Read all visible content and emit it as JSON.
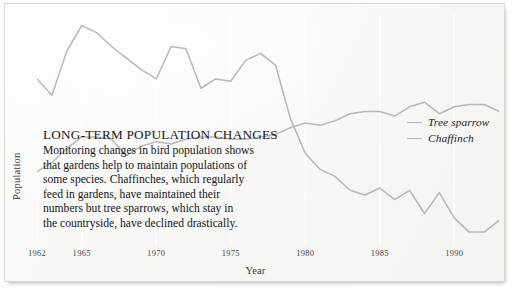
{
  "figure": {
    "background_color": "#f7f7f5",
    "border_color": "#d8d8d4"
  },
  "callout": {
    "headline": "LONG-TERM POPULATION CHANGES",
    "lines": [
      "Monitoring changes in bird population shows",
      "that gardens help to maintain populations of",
      "some species. Chaffinches, which regularly",
      "feed in gardens, have maintained their",
      "numbers but tree sparrows, which stay in",
      "the countryside, have declined drastically."
    ]
  },
  "legend": {
    "position": "right",
    "entries": [
      {
        "label": "Tree sparrow",
        "color": "#b7b7b4"
      },
      {
        "label": "Chaffinch",
        "color": "#b7b7b4"
      }
    ]
  },
  "axes": {
    "ylabel": "Population",
    "xlabel": "Year",
    "xticks": [
      "1962",
      "1965",
      "1970",
      "1975",
      "1980",
      "1985",
      "1990"
    ],
    "yticks": [],
    "grid": "vertical-only"
  },
  "chart_data": {
    "type": "line",
    "title": "LONG-TERM POPULATION CHANGES",
    "xlabel": "Year",
    "ylabel": "Population",
    "xlim": [
      1962,
      1993
    ],
    "ylim": [
      0,
      100
    ],
    "grid": "vertical gridlines at labelled years",
    "legend_position": "right",
    "tick_labels": {
      "x": [
        "1962",
        "1965",
        "1970",
        "1975",
        "1980",
        "1985",
        "1990"
      ],
      "y": []
    },
    "x": [
      1962,
      1963,
      1964,
      1965,
      1966,
      1967,
      1968,
      1969,
      1970,
      1971,
      1972,
      1973,
      1974,
      1975,
      1976,
      1977,
      1978,
      1979,
      1980,
      1981,
      1982,
      1983,
      1984,
      1985,
      1986,
      1987,
      1988,
      1989,
      1990,
      1991,
      1992,
      1993
    ],
    "series": [
      {
        "name": "Tree sparrow",
        "color": "#b7b7b4",
        "values": [
          72,
          65,
          84,
          95,
          92,
          86,
          81,
          76,
          72,
          86,
          85,
          68,
          72,
          71,
          80,
          83,
          78,
          55,
          40,
          33,
          30,
          24,
          22,
          25,
          20,
          24,
          14,
          23,
          12,
          6,
          6,
          11
        ]
      },
      {
        "name": "Chaffinch",
        "color": "#b7b7b4",
        "values": [
          32,
          36,
          42,
          47,
          47,
          46,
          39,
          43,
          45,
          44,
          46,
          47,
          47,
          46,
          46,
          47,
          48,
          51,
          53,
          52,
          54,
          57,
          58,
          58,
          56,
          60,
          62,
          57,
          60,
          61,
          61,
          58
        ]
      }
    ]
  }
}
